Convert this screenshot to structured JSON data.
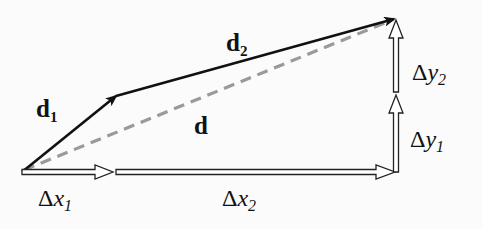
{
  "diagram": {
    "type": "vector-addition",
    "labels": {
      "d1": {
        "base": "d",
        "sub": "1"
      },
      "d2": {
        "base": "d",
        "sub": "2"
      },
      "d": {
        "base": "d"
      },
      "dx1": {
        "delta": "Δ",
        "var": "x",
        "sub": "1"
      },
      "dx2": {
        "delta": "Δ",
        "var": "x",
        "sub": "2"
      },
      "dy1": {
        "delta": "Δ",
        "var": "y",
        "sub": "1"
      },
      "dy2": {
        "delta": "Δ",
        "var": "y",
        "sub": "2"
      }
    },
    "points": {
      "origin": [
        22,
        172
      ],
      "d1_end": [
        116,
        96
      ],
      "d2_end": [
        396,
        18
      ],
      "corner": [
        396,
        172
      ]
    },
    "colors": {
      "solid_vector": "#111111",
      "resultant_dashed": "#9a9a9a",
      "component_outline": "#222222",
      "component_fill": "#ffffff"
    }
  }
}
